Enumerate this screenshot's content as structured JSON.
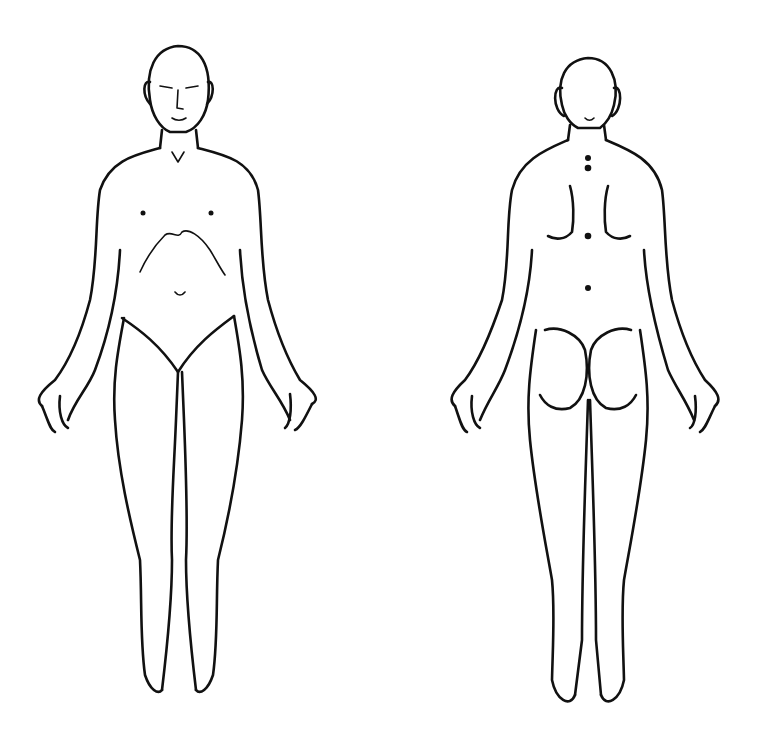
{
  "diagram": {
    "title": "",
    "figures": [
      {
        "name": "front-view",
        "description": "Anterior view of human body outline"
      },
      {
        "name": "back-view",
        "description": "Posterior view of human body outline"
      }
    ],
    "colors": {
      "line": "#111111",
      "background": "#ffffff"
    }
  }
}
